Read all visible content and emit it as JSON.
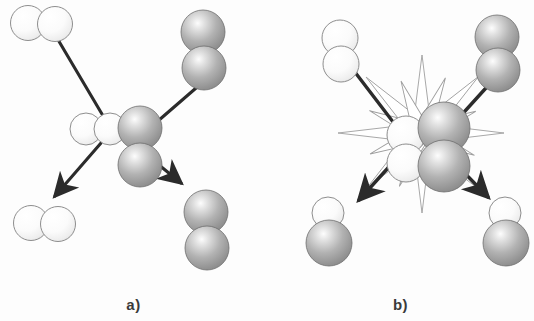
{
  "figure": {
    "type": "scientific-diagram",
    "background_color": "#fdfdfd",
    "panels": [
      {
        "id": "a",
        "label": "a)",
        "process": "non-reactive elastic collision",
        "starburst": false,
        "reactants": [
          {
            "name": "white-diatomic-reactant",
            "position": "top-left",
            "orientation": "horizontal",
            "atoms": [
              {
                "color": "#fafafa",
                "shade": "light"
              },
              {
                "color": "#fafafa",
                "shade": "light"
              }
            ]
          },
          {
            "name": "gray-diatomic-reactant",
            "position": "top-right",
            "orientation": "vertical",
            "atoms": [
              {
                "color": "#9a9a9a",
                "shade": "dark"
              },
              {
                "color": "#9a9a9a",
                "shade": "dark"
              }
            ]
          }
        ],
        "collision_complex": {
          "name": "collision-complex",
          "groups": [
            {
              "orientation": "horizontal",
              "shade": "light",
              "count": 2
            },
            {
              "orientation": "vertical",
              "shade": "dark",
              "count": 2
            }
          ]
        },
        "products": [
          {
            "name": "white-diatomic-product",
            "position": "bottom-left",
            "orientation": "horizontal",
            "atoms": [
              {
                "color": "#fafafa",
                "shade": "light"
              },
              {
                "color": "#fafafa",
                "shade": "light"
              }
            ]
          },
          {
            "name": "gray-diatomic-product",
            "position": "bottom-right",
            "orientation": "vertical",
            "atoms": [
              {
                "color": "#9a9a9a",
                "shade": "dark"
              },
              {
                "color": "#9a9a9a",
                "shade": "dark"
              }
            ]
          }
        ],
        "arrows": [
          {
            "name": "inbound-arrow-left",
            "from": "top-left",
            "to": "center",
            "head": "at-center"
          },
          {
            "name": "inbound-arrow-right",
            "from": "top-right",
            "to": "center",
            "head": "none"
          },
          {
            "name": "outbound-arrow-left",
            "from": "center",
            "to": "bottom-left",
            "head": "at-end"
          },
          {
            "name": "outbound-arrow-right",
            "from": "center",
            "to": "bottom-right",
            "head": "at-end"
          }
        ]
      },
      {
        "id": "b",
        "label": "b)",
        "process": "reactive collision",
        "starburst": true,
        "starburst_spikes": 16,
        "reactants": [
          {
            "name": "white-diatomic-reactant",
            "position": "top-left",
            "orientation": "vertical",
            "atoms": [
              {
                "color": "#fafafa",
                "shade": "light"
              },
              {
                "color": "#fafafa",
                "shade": "light"
              }
            ]
          },
          {
            "name": "gray-diatomic-reactant",
            "position": "top-right",
            "orientation": "vertical",
            "atoms": [
              {
                "color": "#9a9a9a",
                "shade": "dark"
              },
              {
                "color": "#9a9a9a",
                "shade": "dark"
              }
            ]
          }
        ],
        "collision_complex": {
          "name": "collision-complex",
          "groups": [
            {
              "orientation": "vertical",
              "shade": "light",
              "count": 2
            },
            {
              "orientation": "vertical",
              "shade": "dark",
              "count": 2
            }
          ]
        },
        "products": [
          {
            "name": "mixed-diatomic-product",
            "position": "bottom-left",
            "orientation": "vertical",
            "atoms": [
              {
                "color": "#fafafa",
                "shade": "light"
              },
              {
                "color": "#9a9a9a",
                "shade": "dark"
              }
            ]
          },
          {
            "name": "mixed-diatomic-product",
            "position": "bottom-right",
            "orientation": "vertical",
            "atoms": [
              {
                "color": "#fafafa",
                "shade": "light"
              },
              {
                "color": "#9a9a9a",
                "shade": "dark"
              }
            ]
          }
        ],
        "arrows": [
          {
            "name": "inbound-arrow-left",
            "from": "top-left",
            "to": "center",
            "head": "none"
          },
          {
            "name": "inbound-arrow-right",
            "from": "top-right",
            "to": "center",
            "head": "none"
          },
          {
            "name": "outbound-arrow-left",
            "from": "center",
            "to": "bottom-left",
            "head": "at-end"
          },
          {
            "name": "outbound-arrow-right",
            "from": "center",
            "to": "bottom-right",
            "head": "at-end"
          }
        ]
      }
    ],
    "colors": {
      "light_atom": "#fafafa",
      "light_atom_outline": "#8e8e8e",
      "dark_atom": "#9a9a9a",
      "dark_atom_outline": "#6e6e6e",
      "arrow": "#2b2b2b",
      "starburst_stroke": "#9a9a9a",
      "label_text": "#3a3a3a",
      "background": "#fdfdfd"
    }
  }
}
